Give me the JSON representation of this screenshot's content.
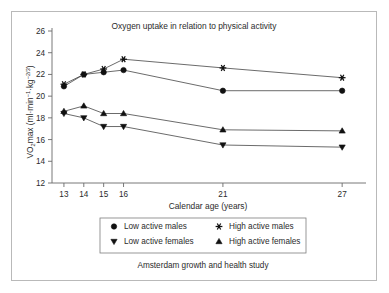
{
  "chart_data": {
    "type": "line",
    "title": "Oxygen uptake in relation to physical activity",
    "subtitle": "Amsterdam growth and health study",
    "xlabel": "Calendar age (years)",
    "ylabel": "VO2max (ml·min−1·kg−2/3)",
    "ylabel_parts": {
      "lead": "VO",
      "sub1": "2",
      "mid": "max (ml·min",
      "sup1": "−1",
      "mid2": "·kg",
      "sup2": "−2/3",
      "tail": ")"
    },
    "x": [
      13,
      14,
      15,
      16,
      21,
      27
    ],
    "xtick_labels": [
      "13",
      "14",
      "15",
      "16",
      "21",
      "27"
    ],
    "xlim": [
      12.4,
      28.2
    ],
    "ytick_labels": [
      "12",
      "14",
      "16",
      "18",
      "20",
      "22",
      "24",
      "26"
    ],
    "yticks": [
      12,
      14,
      16,
      18,
      20,
      22,
      24,
      26
    ],
    "ylim": [
      12,
      26
    ],
    "grid": false,
    "legend_position": "below-axes",
    "series": [
      {
        "name": "Low active males",
        "marker": "circle",
        "values": [
          20.9,
          22.0,
          22.2,
          22.4,
          20.5,
          20.5
        ]
      },
      {
        "name": "High active males",
        "marker": "asterisk",
        "values": [
          21.1,
          22.0,
          22.5,
          23.4,
          22.6,
          21.7
        ]
      },
      {
        "name": "Low active females",
        "marker": "triangle-down",
        "values": [
          18.4,
          18.0,
          17.2,
          17.2,
          15.5,
          15.3
        ]
      },
      {
        "name": "High active females",
        "marker": "triangle-up",
        "values": [
          18.6,
          19.1,
          18.4,
          18.4,
          16.9,
          16.8
        ]
      }
    ]
  },
  "legend": {
    "entries": [
      {
        "label": "Low active males",
        "marker": "circle"
      },
      {
        "label": "High active males",
        "marker": "asterisk"
      },
      {
        "label": "Low active females",
        "marker": "triangle-down"
      },
      {
        "label": "High active females",
        "marker": "triangle-up"
      }
    ]
  },
  "footer": {
    "text": "Amsterdam growth and health study"
  }
}
